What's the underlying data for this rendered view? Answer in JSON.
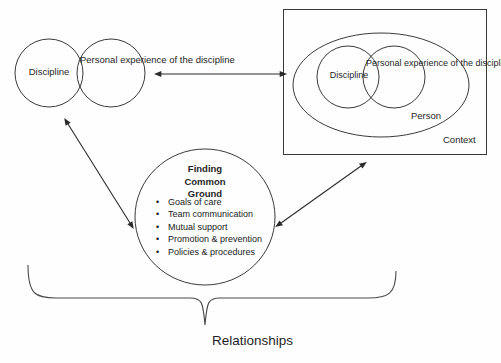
{
  "diagram": {
    "bottom_label": "Relationships",
    "left_group": {
      "circle_a_label": "Discipline",
      "circle_b_label": "Personal experience of the discipline"
    },
    "right_group": {
      "box_label": "Context",
      "ellipse_label": "Person",
      "circle_a_label": "Discipline",
      "circle_b_label": "Personal experience of the discipline"
    },
    "center": {
      "title_line_1": "Finding",
      "title_line_2": "Common",
      "title_line_3": "Ground",
      "title_full": "Finding Common Ground",
      "bullets": [
        "Goals of care",
        "Team communication",
        "Mutual support",
        "Promotion & prevention",
        "Policies & procedures"
      ],
      "bullet_glyph": "•"
    },
    "connectors": [
      {
        "name": "left-venn-to-context-box",
        "style": "double-headed-horizontal"
      },
      {
        "name": "left-venn-to-common-ground",
        "style": "double-headed-diagonal"
      },
      {
        "name": "common-ground-to-context-box",
        "style": "double-headed-diagonal"
      }
    ],
    "colors": {
      "stroke": "#3a3a3a",
      "arrow": "#2b2b2b",
      "text": "#1f1f1f",
      "background": "#fefefe"
    }
  }
}
